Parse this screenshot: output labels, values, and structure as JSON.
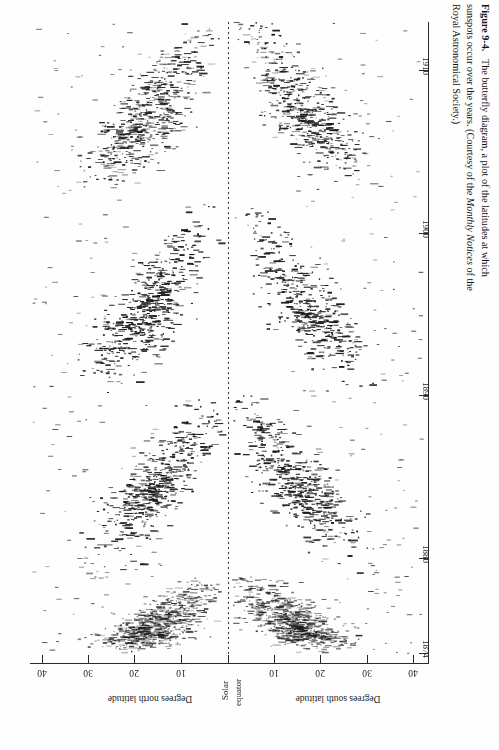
{
  "figure": {
    "number": "Figure 9-4.",
    "caption_line1": "The butterfly diagram, a plot of the latitudes at which",
    "caption_line2_a": "sunspots occur over the years. (Courtesy of the ",
    "caption_line2_italic": "Monthly Notices",
    "caption_line2_b": " of the",
    "caption_line3": "Royal Astronomical Society.)"
  },
  "axes": {
    "latitude": {
      "title_north": "Degrees north latitude",
      "title_south": "Degrees south latitude",
      "equator_label_line1": "Solar",
      "equator_label_line2": "equator",
      "ticks": [
        {
          "label": "40",
          "value": -40,
          "x": 42
        },
        {
          "label": "30",
          "value": -30,
          "x": 88
        },
        {
          "label": "20",
          "value": -20,
          "x": 134
        },
        {
          "label": "10",
          "value": -10,
          "x": 181
        },
        {
          "label": "",
          "value": 0,
          "x": 228
        },
        {
          "label": "10",
          "value": 10,
          "x": 274
        },
        {
          "label": "20",
          "value": 20,
          "x": 320
        },
        {
          "label": "30",
          "value": 30,
          "x": 367
        },
        {
          "label": "40",
          "value": 40,
          "x": 413
        }
      ],
      "range": [
        -45,
        45
      ]
    },
    "year": {
      "ticks": [
        {
          "label": "1874",
          "value": 1874,
          "y": 653
        },
        {
          "label": "1880",
          "value": 1880,
          "y": 558
        },
        {
          "label": "1890",
          "value": 1890,
          "y": 395
        },
        {
          "label": "1900",
          "value": 1900,
          "y": 233
        },
        {
          "label": "1910",
          "value": 1910,
          "y": 70
        }
      ],
      "range": [
        1873.3,
        1914
      ]
    }
  },
  "colors": {
    "ink": "#1a1a1a",
    "axis": "#2a2a2a",
    "paper": "#fefefe",
    "mark": "#333333"
  },
  "chart_data": {
    "type": "scatter",
    "xlabel": "Degrees north latitude / Degrees south latitude",
    "ylabel": "Year",
    "xlim": [
      -45,
      45
    ],
    "ylim": [
      1873.3,
      1914
    ],
    "grid": false,
    "legend": null,
    "orientation": "year axis vertical (1874 bottom to 1910 top), latitude axis horizontal, north left / south right",
    "marker": "short horizontal dash",
    "equator_line": {
      "value": 0,
      "style": "dotted",
      "label": "Solar equator"
    },
    "cycles": [
      {
        "name": "Cycle 11",
        "start": 1874.0,
        "max": 1875.0,
        "end": 1878.8,
        "start_lat": 24,
        "end_lat": 5,
        "peak_density": 0.62
      },
      {
        "name": "Cycle 12",
        "start": 1878.8,
        "max": 1883.9,
        "end": 1890.0,
        "start_lat": 32,
        "end_lat": 4,
        "peak_density": 0.92
      },
      {
        "name": "Cycle 13",
        "start": 1890.0,
        "max": 1894.1,
        "end": 1902.0,
        "start_lat": 33,
        "end_lat": 4,
        "peak_density": 1.0
      },
      {
        "name": "Cycle 14",
        "start": 1902.0,
        "max": 1906.2,
        "end": 1913.6,
        "start_lat": 32,
        "end_lat": 5,
        "peak_density": 0.85
      }
    ],
    "series": [
      {
        "name": "Northern hemisphere spots",
        "hemisphere": "north",
        "sign": -1
      },
      {
        "name": "Southern hemisphere spots",
        "hemisphere": "south",
        "sign": 1
      }
    ]
  }
}
